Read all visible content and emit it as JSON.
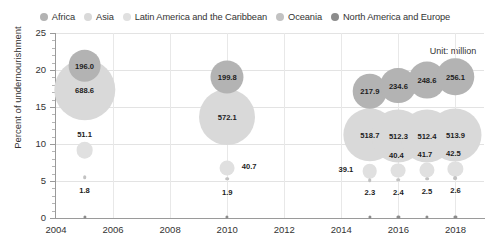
{
  "legend": {
    "items": [
      {
        "label": "Africa",
        "color": "#b3b3b3",
        "marker": "legend-dot-africa"
      },
      {
        "label": "Asia",
        "color": "#d9d9d9",
        "marker": "legend-dot-asia"
      },
      {
        "label": "Latin America and the Caribbean",
        "color": "#e0e0e0",
        "marker": "legend-dot-latin-america"
      },
      {
        "label": "Oceania",
        "color": "#c2c2c2",
        "marker": "legend-dot-oceania"
      },
      {
        "label": "North America and Europe",
        "color": "#8c8c8c",
        "marker": "legend-dot-north-america-europe"
      }
    ]
  },
  "annotation": {
    "unit": "Unit: million"
  },
  "chart_data": {
    "type": "scatter",
    "title": "",
    "xlabel": "",
    "ylabel": "Percent of undernourishment",
    "xlim": [
      2004,
      2019
    ],
    "ylim": [
      0,
      25
    ],
    "xticks": [
      2004,
      2006,
      2008,
      2010,
      2012,
      2014,
      2016,
      2018
    ],
    "yticks": [
      0,
      5,
      10,
      15,
      20,
      25
    ],
    "ytick_minor_step": 1,
    "grid": true,
    "legend_position": "top-center",
    "bubble_size_unit": "million people undernourished",
    "series": [
      {
        "name": "Africa",
        "color": "#b3b3b3",
        "points": [
          {
            "x": 2005,
            "y": 20.6,
            "value": 196.0,
            "label": "196.0"
          },
          {
            "x": 2010,
            "y": 19.0,
            "value": 199.8,
            "label": "199.8"
          },
          {
            "x": 2015,
            "y": 17.1,
            "value": 217.9,
            "label": "217.9"
          },
          {
            "x": 2016,
            "y": 17.9,
            "value": 234.6,
            "label": "234.6"
          },
          {
            "x": 2017,
            "y": 18.6,
            "value": 248.6,
            "label": "248.6"
          },
          {
            "x": 2018,
            "y": 19.1,
            "value": 256.1,
            "label": "256.1"
          }
        ]
      },
      {
        "name": "Asia",
        "color": "#d9d9d9",
        "points": [
          {
            "x": 2005,
            "y": 17.3,
            "value": 688.6,
            "label": "688.6"
          },
          {
            "x": 2010,
            "y": 13.7,
            "value": 572.1,
            "label": "572.1"
          },
          {
            "x": 2015,
            "y": 11.2,
            "value": 518.7,
            "label": "518.7"
          },
          {
            "x": 2016,
            "y": 11.1,
            "value": 512.3,
            "label": "512.3"
          },
          {
            "x": 2017,
            "y": 11.1,
            "value": 512.4,
            "label": "512.4"
          },
          {
            "x": 2018,
            "y": 11.2,
            "value": 513.9,
            "label": "513.9"
          }
        ]
      },
      {
        "name": "Latin America and the Caribbean",
        "color": "#e0e0e0",
        "points": [
          {
            "x": 2005,
            "y": 9.2,
            "value": 51.1,
            "label": "51.1"
          },
          {
            "x": 2010,
            "y": 6.7,
            "value": 40.7,
            "label": "40.7"
          },
          {
            "x": 2015,
            "y": 6.3,
            "value": 39.1,
            "label": "39.1"
          },
          {
            "x": 2016,
            "y": 6.4,
            "value": 40.4,
            "label": "40.4"
          },
          {
            "x": 2017,
            "y": 6.5,
            "value": 41.7,
            "label": "41.7"
          },
          {
            "x": 2018,
            "y": 6.6,
            "value": 42.5,
            "label": "42.5"
          }
        ]
      },
      {
        "name": "Oceania",
        "color": "#c2c2c2",
        "points": [
          {
            "x": 2005,
            "y": 5.5,
            "value": 1.8,
            "label": "1.8"
          },
          {
            "x": 2010,
            "y": 5.3,
            "value": 1.9,
            "label": "1.9"
          },
          {
            "x": 2015,
            "y": 5.1,
            "value": 2.3,
            "label": "2.3"
          },
          {
            "x": 2016,
            "y": 5.2,
            "value": 2.4,
            "label": "2.4"
          },
          {
            "x": 2017,
            "y": 5.3,
            "value": 2.5,
            "label": "2.5"
          },
          {
            "x": 2018,
            "y": 5.4,
            "value": 2.6,
            "label": "2.6"
          }
        ]
      },
      {
        "name": "North America and Europe",
        "color": "#8c8c8c",
        "points": [
          {
            "x": 2005,
            "y": 0.1,
            "value": 0.0,
            "label": ""
          },
          {
            "x": 2010,
            "y": 0.1,
            "value": 0.0,
            "label": ""
          },
          {
            "x": 2015,
            "y": 0.1,
            "value": 0.0,
            "label": ""
          },
          {
            "x": 2016,
            "y": 0.1,
            "value": 0.0,
            "label": ""
          },
          {
            "x": 2017,
            "y": 0.1,
            "value": 0.0,
            "label": ""
          },
          {
            "x": 2018,
            "y": 0.1,
            "value": 0.0,
            "label": ""
          }
        ]
      }
    ],
    "label_offsets": {
      "51.1": [
        0,
        -16
      ],
      "40.7": [
        22,
        -2
      ],
      "39.1": [
        -24,
        -2
      ],
      "40.4": [
        -2,
        -16
      ],
      "41.7": [
        -2,
        -16
      ],
      "42.5": [
        -2,
        -16
      ],
      "1.8": [
        0,
        13
      ],
      "1.9": [
        0,
        13
      ],
      "2.3": [
        0,
        12
      ],
      "2.4": [
        0,
        12
      ],
      "2.5": [
        0,
        12
      ],
      "2.6": [
        0,
        12
      ]
    }
  }
}
